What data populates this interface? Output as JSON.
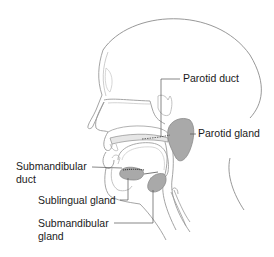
{
  "diagram": {
    "colors": {
      "outline": "#8c8c8c",
      "structure": "#b4b4b4",
      "gland_fill": "#a9a9a9",
      "label_text": "#1a1a1a",
      "leader_line": "#555555"
    },
    "labels": {
      "parotid_duct": "Parotid duct",
      "parotid_gland": "Parotid gland",
      "submandibular_duct_line1": "Submandibular",
      "submandibular_duct_line2": "duct",
      "sublingual_gland": "Sublingual gland",
      "submandibular_gland_line1": "Submandibular",
      "submandibular_gland_line2": "gland"
    }
  }
}
